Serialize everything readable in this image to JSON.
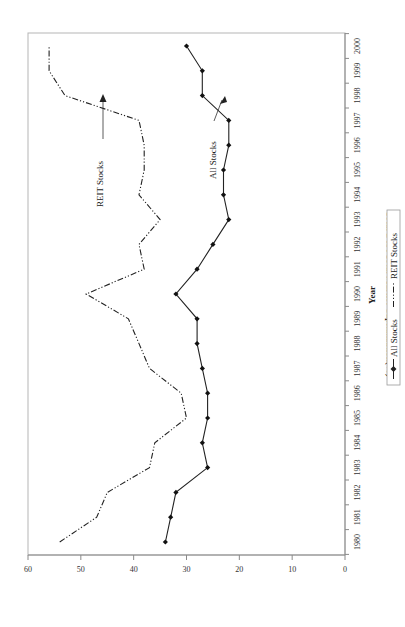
{
  "chart_data": {
    "type": "line",
    "orientation": "rotated 90 degrees counter-clockwise (x axis runs bottom-to-top along right edge)",
    "title": "",
    "xlabel": "Year",
    "ylabel": "Total Debt/Total Market Capitalization(%)",
    "x": [
      1980,
      1981,
      1982,
      1983,
      1984,
      1985,
      1986,
      1987,
      1988,
      1989,
      1990,
      1991,
      1992,
      1993,
      1994,
      1995,
      1996,
      1997,
      1998,
      1999,
      2000
    ],
    "x_tick_labels": [
      "1980",
      "1981",
      "1982",
      "1983",
      "1984",
      "1985",
      "1986",
      "1987",
      "1988",
      "1989",
      "1990",
      "1991",
      "1992",
      "1993",
      "1994",
      "1995",
      "1996",
      "1997",
      "1998",
      "1999",
      "2000"
    ],
    "y_ticks": [
      0,
      10,
      20,
      30,
      40,
      50,
      60
    ],
    "ylim": [
      0,
      60
    ],
    "grid": false,
    "legend_position": "bottom",
    "series": [
      {
        "name": "All Stocks",
        "style": "solid line with diamond markers",
        "values": [
          34,
          33,
          32,
          26,
          27,
          26,
          26,
          27,
          28,
          28,
          32,
          28,
          25,
          22,
          23,
          23,
          22,
          22,
          27,
          27,
          30
        ]
      },
      {
        "name": "REIT Stocks",
        "style": "dash-dot-dot line, no markers",
        "values": [
          54,
          47,
          45,
          37,
          36,
          30,
          31,
          37,
          39,
          41,
          49,
          38,
          39,
          35,
          39,
          38,
          38,
          39,
          53,
          56,
          56
        ]
      }
    ],
    "annotations": [
      {
        "text": "REIT Stocks",
        "arrow_to_year": 1998,
        "arrow_to_value": 51
      },
      {
        "text": "All Stocks",
        "arrow_to_year": 1997,
        "arrow_to_value": 23
      }
    ]
  },
  "labels": {
    "ylabel": "Total Debt/Total Market Capitalization(%)",
    "xlabel": "Year",
    "legend_all": "All Stocks",
    "legend_reit": "REIT Stocks",
    "anno_reit": "REIT Stocks",
    "anno_all": "All Stocks"
  },
  "colors": {
    "line": "#222222",
    "axis": "#8a8a8a",
    "frame": "#b5b5b5",
    "background": "#ffffff"
  }
}
